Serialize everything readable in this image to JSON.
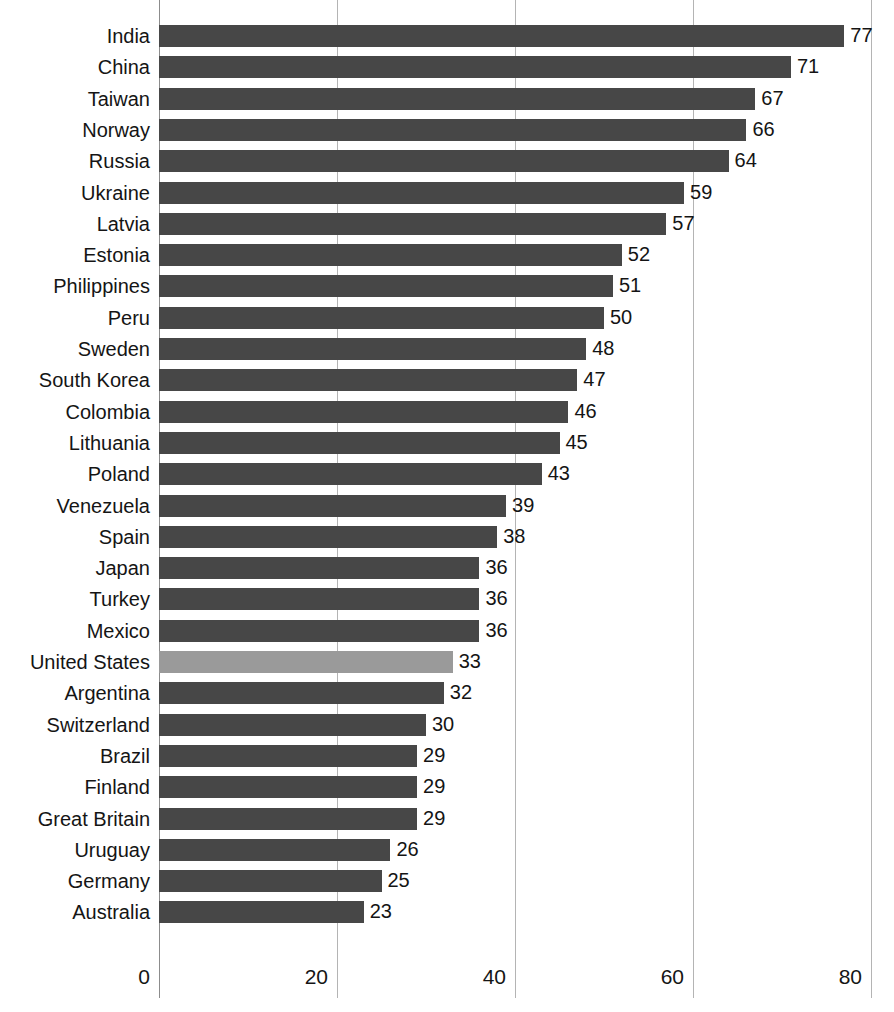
{
  "chart_data": {
    "type": "bar",
    "orientation": "horizontal",
    "title": "",
    "subtitle": "",
    "xlabel": "",
    "ylabel": "",
    "xlim": [
      0,
      82.5
    ],
    "xticks": [
      0,
      20,
      40,
      60,
      80
    ],
    "xtick_labels": [
      "0",
      "20",
      "40",
      "60",
      "80"
    ],
    "grid": "vertical",
    "legend": "none",
    "value_labels": true,
    "categories": [
      "India",
      "China",
      "Taiwan",
      "Norway",
      "Russia",
      "Ukraine",
      "Latvia",
      "Estonia",
      "Philippines",
      "Peru",
      "Sweden",
      "South Korea",
      "Colombia",
      "Lithuania",
      "Poland",
      "Venezuela",
      "Spain",
      "Japan",
      "Turkey",
      "Mexico",
      "United States",
      "Argentina",
      "Switzerland",
      "Brazil",
      "Finland",
      "Great Britain",
      "Uruguay",
      "Germany",
      "Australia"
    ],
    "values": [
      77,
      71,
      67,
      66,
      64,
      59,
      57,
      52,
      51,
      50,
      48,
      47,
      46,
      45,
      43,
      39,
      38,
      36,
      36,
      36,
      33,
      32,
      30,
      29,
      29,
      29,
      26,
      25,
      23
    ],
    "highlight_category": "United States",
    "colors": {
      "bar": "#474747",
      "bar_highlight": "#9a9a9a",
      "gridline": "#b4b4b4",
      "axis": "#8c8c8c",
      "text": "#151515",
      "background": "#ffffff"
    }
  }
}
